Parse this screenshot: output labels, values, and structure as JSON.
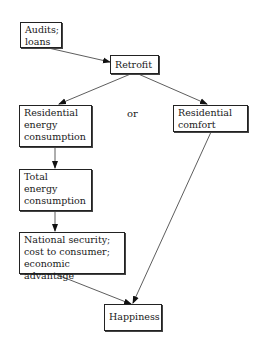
{
  "diagram": {
    "nodes": {
      "audits": "Audits;\nloans",
      "retrofit": "Retrofit",
      "res_energy": "Residential\nenergy\nconsumption",
      "res_comfort": "Residential\ncomfort",
      "total_energy": "Total\nenergy\nconsumption",
      "national": "National security;\ncost to consumer;\neconomic advantage",
      "happiness": "Happiness"
    },
    "or_label": "or",
    "edges": [
      {
        "from": "Audits; loans",
        "to": "Retrofit"
      },
      {
        "from": "Retrofit",
        "to": "Residential energy consumption"
      },
      {
        "from": "Retrofit",
        "to": "Residential comfort"
      },
      {
        "from": "Residential energy consumption",
        "to": "Total energy consumption"
      },
      {
        "from": "Total energy consumption",
        "to": "National security; cost to consumer; economic advantage"
      },
      {
        "from": "National security; cost to consumer; economic advantage",
        "to": "Happiness"
      },
      {
        "from": "Residential comfort",
        "to": "Happiness"
      }
    ]
  }
}
